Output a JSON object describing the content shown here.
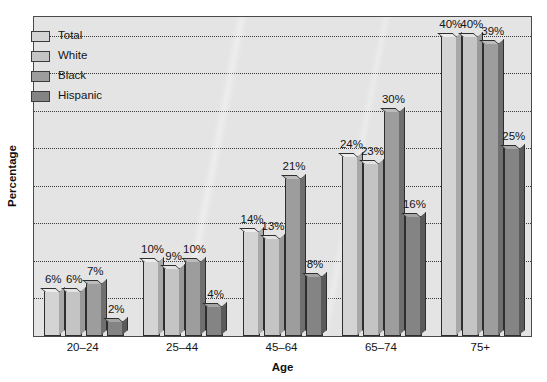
{
  "chart_data": {
    "type": "bar",
    "title": "",
    "xlabel": "Age",
    "ylabel": "Percentage",
    "categories": [
      "20–24",
      "25–44",
      "45–64",
      "65–74",
      "75+"
    ],
    "series": [
      {
        "name": "Total",
        "color": "#d4d4d4",
        "side_color": "#a8a8a8",
        "top_color": "#ececec",
        "values": [
          6,
          10,
          14,
          24,
          40
        ],
        "labels": [
          "6%",
          "10%",
          "14%",
          "24%",
          "40%"
        ]
      },
      {
        "name": "White",
        "color": "#c4c4c4",
        "side_color": "#999999",
        "top_color": "#e2e2e2",
        "values": [
          6,
          9,
          13,
          23,
          40
        ],
        "labels": [
          "6%",
          "9%",
          "13%",
          "23%",
          "40%"
        ]
      },
      {
        "name": "Black",
        "color": "#9d9d9d",
        "side_color": "#6f6f6f",
        "top_color": "#bcbcbc",
        "values": [
          7,
          10,
          21,
          30,
          39
        ],
        "labels": [
          "7%",
          "10%",
          "21%",
          "30%",
          "39%"
        ]
      },
      {
        "name": "Hispanic",
        "color": "#848484",
        "side_color": "#5a5a5a",
        "top_color": "#a5a5a5",
        "values": [
          2,
          4,
          8,
          16,
          25
        ],
        "labels": [
          "2%",
          "4%",
          "8%",
          "16%",
          "25%"
        ]
      }
    ],
    "ylim": [
      0,
      42.5
    ],
    "y_gridlines": [
      5,
      10,
      15,
      20,
      25,
      30,
      35,
      40
    ],
    "y_tick_labels": [],
    "grid": true,
    "legend_position": "top-left",
    "value_labels_shown": true,
    "plot_background": "#e4e4e4",
    "gridline_color": "#3b3b3b",
    "frame_color": "#4a4a4a"
  },
  "legend": {
    "items": [
      {
        "label": "Total"
      },
      {
        "label": "White"
      },
      {
        "label": "Black"
      },
      {
        "label": "Hispanic"
      }
    ]
  },
  "axes": {
    "y_title": "Percentage",
    "x_title": "Age"
  }
}
